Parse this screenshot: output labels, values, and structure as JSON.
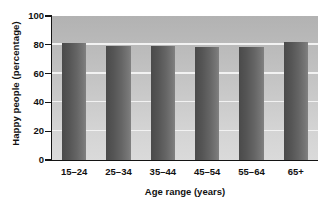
{
  "chart_data": {
    "type": "bar",
    "title": "",
    "subtitle": "",
    "xlabel": "Age range (years)",
    "ylabel": "Happy people (percentage)",
    "categories": [
      "15–24",
      "25–34",
      "35–44",
      "45–54",
      "55–64",
      "65+"
    ],
    "values": [
      81,
      79,
      79.5,
      78.5,
      78.5,
      82
    ],
    "series": [
      {
        "name": "Happy people",
        "values": [
          81,
          79,
          79.5,
          78.5,
          78.5,
          82
        ]
      }
    ],
    "ylim": [
      0,
      100
    ],
    "yticks": [
      0,
      20,
      40,
      60,
      80,
      100
    ],
    "ytick_labels": [
      "0",
      "20",
      "40",
      "60",
      "80",
      "100"
    ],
    "grid": "horizontal",
    "gridline_values": [
      20,
      40,
      60,
      80
    ],
    "legend": null,
    "legend_position": "none",
    "annotations": [],
    "colors": {
      "bar_dark": "#4a4a4a",
      "bar_light": "#818181",
      "plot_background_top": "#b2b2b2",
      "plot_background_bottom": "#dadada",
      "gridline": "#f2f2f2",
      "axis": "#141414",
      "text": "#111111",
      "figure_background": "#ffffff"
    }
  }
}
